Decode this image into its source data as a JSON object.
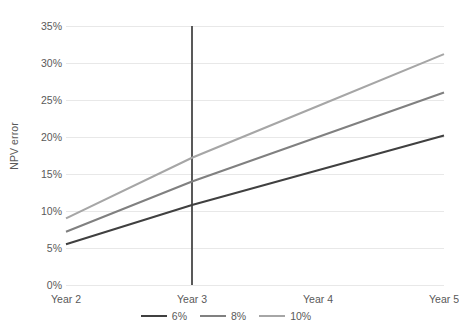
{
  "chart_data": {
    "type": "line",
    "title": "",
    "xlabel": "",
    "ylabel": "NPV error",
    "categories": [
      "Year 2",
      "Year 3",
      "Year 4",
      "Year 5"
    ],
    "ylim": [
      0,
      35
    ],
    "yticks": [
      0,
      5,
      10,
      15,
      20,
      25,
      30,
      35
    ],
    "ytick_labels": [
      "0%",
      "5%",
      "10%",
      "15%",
      "20%",
      "25%",
      "30%",
      "35%"
    ],
    "grid": true,
    "legend_position": "bottom",
    "annotations": [
      {
        "name": "year-3-reference-line",
        "type": "vertical-line",
        "x": "Year 3",
        "y_from": 0,
        "y_to": 35,
        "color": "#595959"
      }
    ],
    "series": [
      {
        "name": "6%",
        "color": "#404040",
        "values": [
          5.5,
          10.8,
          15.5,
          20.2
        ]
      },
      {
        "name": "8%",
        "color": "#808080",
        "values": [
          7.2,
          14.0,
          20.0,
          26.0
        ]
      },
      {
        "name": "10%",
        "color": "#a6a6a6",
        "values": [
          9.0,
          17.2,
          24.2,
          31.2
        ]
      }
    ]
  },
  "axes": {
    "y_title": "NPV error",
    "y_tick_labels": [
      "35%",
      "30%",
      "25%",
      "20%",
      "15%",
      "10%",
      "5%",
      "0%"
    ],
    "x_tick_labels": [
      "Year 2",
      "Year 3",
      "Year 4",
      "Year 5"
    ]
  },
  "legend": {
    "items": [
      {
        "label": "6%",
        "color": "#404040"
      },
      {
        "label": "8%",
        "color": "#808080"
      },
      {
        "label": "10%",
        "color": "#a6a6a6"
      }
    ]
  },
  "style": {
    "gridline_color": "#e8e8e8",
    "text_color": "#595959",
    "background": "#ffffff"
  }
}
